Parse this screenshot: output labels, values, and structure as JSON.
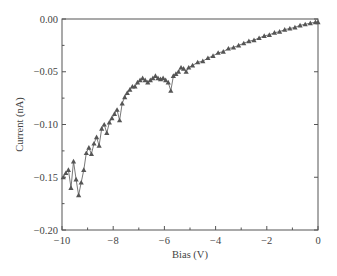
{
  "chart_data": {
    "type": "line",
    "title": "",
    "xlabel": "Bias (V)",
    "ylabel": "Current (nA)",
    "xlim": [
      -10,
      0
    ],
    "ylim": [
      -0.2,
      0.0
    ],
    "x_ticks": [
      -10,
      -8,
      -6,
      -4,
      -2,
      0
    ],
    "x_tick_labels": [
      "−10",
      "−8",
      "−6",
      "−4",
      "−2",
      "0"
    ],
    "y_ticks": [
      0.0,
      -0.05,
      -0.1,
      -0.15,
      -0.2
    ],
    "y_tick_labels": [
      "0.00",
      "−0.05",
      "−0.10",
      "−0.15",
      "−0.20"
    ],
    "grid": false,
    "legend": null,
    "marker": "triangle",
    "color": "#555555",
    "series": [
      {
        "name": "I-V",
        "x": [
          -9.95,
          -9.85,
          -9.75,
          -9.65,
          -9.55,
          -9.45,
          -9.35,
          -9.25,
          -9.15,
          -9.05,
          -8.95,
          -8.85,
          -8.75,
          -8.65,
          -8.55,
          -8.45,
          -8.35,
          -8.25,
          -8.15,
          -8.05,
          -7.95,
          -7.85,
          -7.75,
          -7.65,
          -7.55,
          -7.45,
          -7.35,
          -7.25,
          -7.15,
          -7.05,
          -6.95,
          -6.85,
          -6.75,
          -6.65,
          -6.55,
          -6.45,
          -6.35,
          -6.25,
          -6.15,
          -6.05,
          -5.95,
          -5.85,
          -5.75,
          -5.65,
          -5.55,
          -5.45,
          -5.35,
          -5.25,
          -5.15,
          -5.05,
          -4.9,
          -4.7,
          -4.5,
          -4.3,
          -4.1,
          -3.9,
          -3.7,
          -3.5,
          -3.3,
          -3.1,
          -2.9,
          -2.7,
          -2.5,
          -2.3,
          -2.1,
          -1.9,
          -1.7,
          -1.5,
          -1.3,
          -1.1,
          -0.9,
          -0.7,
          -0.5,
          -0.3,
          -0.1,
          0.0
        ],
        "y": [
          -0.15,
          -0.146,
          -0.143,
          -0.16,
          -0.135,
          -0.152,
          -0.167,
          -0.155,
          -0.143,
          -0.127,
          -0.122,
          -0.128,
          -0.118,
          -0.112,
          -0.12,
          -0.104,
          -0.1,
          -0.108,
          -0.098,
          -0.094,
          -0.09,
          -0.086,
          -0.096,
          -0.08,
          -0.074,
          -0.07,
          -0.067,
          -0.064,
          -0.064,
          -0.06,
          -0.058,
          -0.056,
          -0.058,
          -0.06,
          -0.058,
          -0.056,
          -0.054,
          -0.056,
          -0.057,
          -0.056,
          -0.058,
          -0.06,
          -0.068,
          -0.054,
          -0.052,
          -0.05,
          -0.046,
          -0.047,
          -0.05,
          -0.046,
          -0.044,
          -0.041,
          -0.04,
          -0.037,
          -0.035,
          -0.032,
          -0.031,
          -0.028,
          -0.027,
          -0.025,
          -0.023,
          -0.021,
          -0.02,
          -0.018,
          -0.016,
          -0.015,
          -0.013,
          -0.012,
          -0.01,
          -0.009,
          -0.008,
          -0.006,
          -0.005,
          -0.004,
          -0.003,
          -0.003
        ]
      }
    ]
  }
}
